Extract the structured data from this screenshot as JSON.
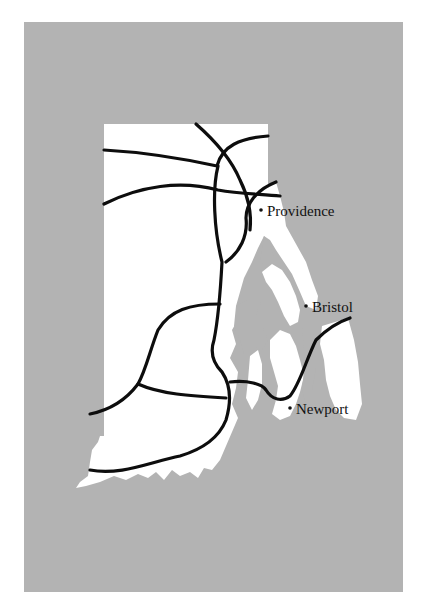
{
  "map": {
    "subject": "Rhode Island",
    "colors": {
      "background": "#ffffff",
      "water": "#b3b3b3",
      "land": "#ffffff",
      "roads": "#0d0d0d",
      "labels": "#111111"
    },
    "cities": [
      {
        "name": "Providence",
        "dot_x": 261,
        "dot_y": 210,
        "label_x": 267,
        "label_y": 216
      },
      {
        "name": "Bristol",
        "dot_x": 306,
        "dot_y": 306,
        "label_x": 312,
        "label_y": 312
      },
      {
        "name": "Newport",
        "dot_x": 290,
        "dot_y": 408,
        "label_x": 296,
        "label_y": 414
      }
    ]
  }
}
